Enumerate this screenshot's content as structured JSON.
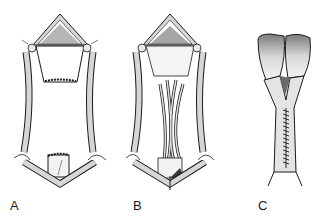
{
  "figure": {
    "panels": [
      {
        "id": "A",
        "label": "A",
        "description": "Opened tubular structure with superior and inferior segments retracted by four stay sutures"
      },
      {
        "id": "B",
        "label": "B",
        "description": "Sutures placed between superior and inferior segments, crossing the defect"
      },
      {
        "id": "C",
        "label": "C",
        "description": "Completed closure with running suture line along the joined tube"
      }
    ]
  },
  "colors": {
    "stroke": "#1a1a1a",
    "tissue": "#d6d6d6",
    "shade": "#8a8a8a",
    "background": "#ffffff"
  }
}
